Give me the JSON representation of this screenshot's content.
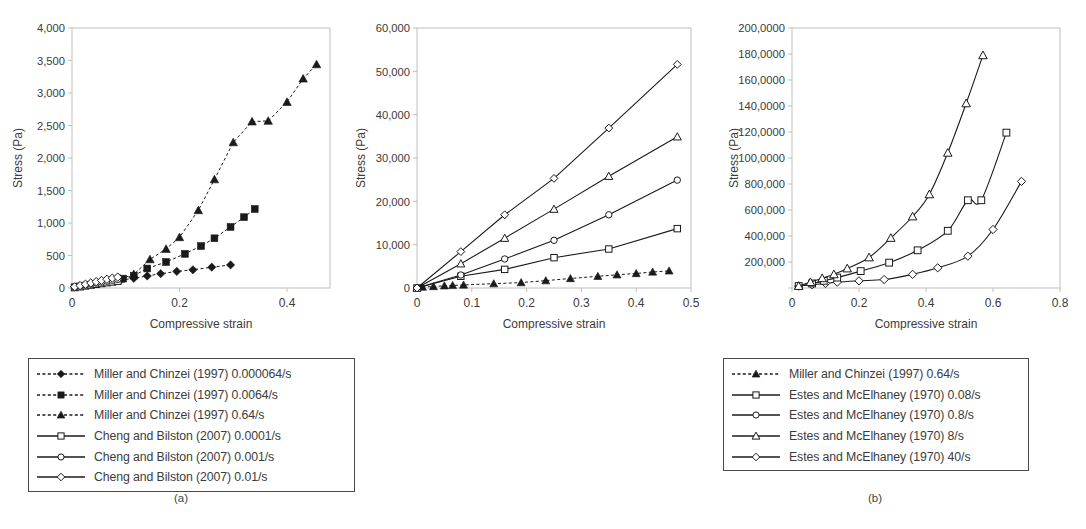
{
  "figure": {
    "background": "#ffffff",
    "line_color": "#1a1a1a",
    "axis_color": "#bfbfbf",
    "text_color": "#3b3b3b"
  },
  "panels": [
    {
      "id": "a",
      "caption": "(a)",
      "xlabel": "Compressive strain",
      "ylabel": "Stress (Pa)",
      "legend": [
        {
          "label": "Miller and Chinzei (1997) 0.000064/s",
          "marker": "diamond-filled",
          "line": "dashed"
        },
        {
          "label": "Miller and Chinzei (1997) 0.0064/s",
          "marker": "square-filled",
          "line": "dashed"
        },
        {
          "label": "Miller and Chinzei (1997) 0.64/s",
          "marker": "triangle-filled",
          "line": "dashed"
        },
        {
          "label": "Cheng and Bilston (2007) 0.0001/s",
          "marker": "square-open",
          "line": "solid"
        },
        {
          "label": "Cheng and Bilston (2007) 0.001/s",
          "marker": "circle-open",
          "line": "solid"
        },
        {
          "label": "Cheng and Bilston (2007) 0.01/s",
          "marker": "diamond-open",
          "line": "solid"
        }
      ]
    },
    {
      "id": "b",
      "caption": "(b)",
      "xlabel": "Compressive strain",
      "ylabel": "Stress (Pa)",
      "legend": [
        {
          "label": "Miller and Chinzei (1997) 0.64/s",
          "marker": "triangle-filled",
          "line": "dashed"
        },
        {
          "label": "Estes and McElhaney (1970) 0.08/s",
          "marker": "square-open",
          "line": "solid"
        },
        {
          "label": "Estes and McElhaney (1970) 0.8/s",
          "marker": "circle-open",
          "line": "solid"
        },
        {
          "label": "Estes and McElhaney (1970) 8/s",
          "marker": "triangle-open",
          "line": "solid"
        },
        {
          "label": "Estes and McElhaney (1970) 40/s",
          "marker": "diamond-open",
          "line": "solid"
        }
      ]
    },
    {
      "id": "c",
      "caption": "(c)",
      "xlabel": "Compressive strain",
      "ylabel": "Stress (Pa)",
      "legend": [
        {
          "label": "Pervin and Chen (2009) 1000/s",
          "marker": "diamond-open",
          "line": "solid"
        },
        {
          "label": "Pervin and Chen (2009) 2000/s",
          "marker": "square-open",
          "line": "solid"
        },
        {
          "label": "Pervin and Chen (2009) 3000/s",
          "marker": "triangle-open",
          "line": "solid"
        }
      ]
    }
  ],
  "chart_data": [
    {
      "panel": "a",
      "type": "line",
      "title": "",
      "xlabel": "Compressive strain",
      "ylabel": "Stress (Pa)",
      "xlim": [
        0,
        0.48
      ],
      "ylim": [
        0,
        4000
      ],
      "xticks": [
        0,
        0.2,
        0.4
      ],
      "xticklabels": [
        "0",
        "0.2",
        "0.4"
      ],
      "yticks": [
        0,
        500,
        1000,
        1500,
        2000,
        2500,
        3000,
        3500,
        4000
      ],
      "yticklabels": [
        "0",
        "500",
        "1,000",
        "1,500",
        "2,000",
        "2,500",
        "3,000",
        "3,500",
        "4,000"
      ],
      "grid": false,
      "legend_position": "below",
      "series": [
        {
          "name": "Miller and Chinzei (1997) 0.000064/s",
          "marker": "diamond-filled",
          "line": "dashed",
          "x": [
            0.09,
            0.115,
            0.14,
            0.165,
            0.195,
            0.225,
            0.26,
            0.295
          ],
          "y": [
            120,
            150,
            185,
            220,
            255,
            280,
            320,
            355
          ]
        },
        {
          "name": "Miller and Chinzei (1997) 0.0064/s",
          "marker": "square-filled",
          "line": "dashed",
          "x": [
            0.095,
            0.115,
            0.14,
            0.175,
            0.21,
            0.24,
            0.265,
            0.295,
            0.32,
            0.34
          ],
          "y": [
            145,
            190,
            300,
            400,
            525,
            645,
            765,
            940,
            1090,
            1215
          ]
        },
        {
          "name": "Miller and Chinzei (1997) 0.64/s",
          "marker": "triangle-filled",
          "line": "dashed",
          "x": [
            0.09,
            0.115,
            0.145,
            0.175,
            0.2,
            0.235,
            0.265,
            0.3,
            0.335,
            0.365,
            0.4,
            0.43,
            0.455
          ],
          "y": [
            140,
            210,
            440,
            600,
            780,
            1195,
            1670,
            2240,
            2560,
            2570,
            2860,
            3220,
            3440
          ]
        },
        {
          "name": "Cheng and Bilston (2007) 0.0001/s",
          "marker": "square-open",
          "line": "solid",
          "x": [
            0.005,
            0.015,
            0.025,
            0.035,
            0.045,
            0.055,
            0.065,
            0.075,
            0.085
          ],
          "y": [
            10,
            22,
            35,
            48,
            60,
            72,
            85,
            96,
            108
          ]
        },
        {
          "name": "Cheng and Bilston (2007) 0.001/s",
          "marker": "circle-open",
          "line": "solid",
          "x": [
            0.005,
            0.015,
            0.025,
            0.035,
            0.045,
            0.055,
            0.065,
            0.075,
            0.085
          ],
          "y": [
            14,
            30,
            46,
            62,
            78,
            93,
            108,
            122,
            136
          ]
        },
        {
          "name": "Cheng and Bilston (2007) 0.01/s",
          "marker": "diamond-open",
          "line": "solid",
          "x": [
            0.005,
            0.015,
            0.025,
            0.035,
            0.045,
            0.055,
            0.065,
            0.075,
            0.085
          ],
          "y": [
            18,
            38,
            58,
            78,
            98,
            116,
            134,
            152,
            168
          ]
        }
      ]
    },
    {
      "panel": "b",
      "type": "line",
      "title": "",
      "xlabel": "Compressive strain",
      "ylabel": "Stress (Pa)",
      "xlim": [
        0,
        0.5
      ],
      "ylim": [
        0,
        60000
      ],
      "xticks": [
        0,
        0.1,
        0.2,
        0.3,
        0.4,
        0.5
      ],
      "xticklabels": [
        "0",
        "0.1",
        "0.2",
        "0.3",
        "0.4",
        "0.5"
      ],
      "yticks": [
        0,
        10000,
        20000,
        30000,
        40000,
        50000,
        60000
      ],
      "yticklabels": [
        "0",
        "10,000",
        "20,000",
        "30,000",
        "40,000",
        "50,000",
        "60,000"
      ],
      "grid": false,
      "legend_position": "below",
      "series": [
        {
          "name": "Miller and Chinzei (1997) 0.64/s",
          "marker": "triangle-filled",
          "line": "dashed",
          "x": [
            0.01,
            0.03,
            0.05,
            0.065,
            0.085,
            0.14,
            0.19,
            0.235,
            0.28,
            0.33,
            0.365,
            0.4,
            0.43,
            0.46
          ],
          "y": [
            200,
            350,
            500,
            600,
            700,
            1000,
            1250,
            1700,
            2200,
            2700,
            3050,
            3350,
            3700,
            3950
          ]
        },
        {
          "name": "Estes and McElhaney (1970) 0.08/s",
          "marker": "square-open",
          "line": "solid",
          "x": [
            0.0,
            0.08,
            0.16,
            0.25,
            0.35,
            0.475
          ],
          "y": [
            0,
            2700,
            4300,
            7000,
            9000,
            13700
          ]
        },
        {
          "name": "Estes and McElhaney (1970) 0.8/s",
          "marker": "circle-open",
          "line": "solid",
          "x": [
            0.0,
            0.08,
            0.16,
            0.25,
            0.35,
            0.475
          ],
          "y": [
            0,
            3000,
            6700,
            11000,
            16900,
            24900
          ]
        },
        {
          "name": "Estes and McElhaney (1970) 8/s",
          "marker": "triangle-open",
          "line": "solid",
          "x": [
            0.0,
            0.08,
            0.16,
            0.25,
            0.35,
            0.475
          ],
          "y": [
            0,
            5600,
            11500,
            18200,
            25800,
            34900
          ]
        },
        {
          "name": "Estes and McElhaney (1970) 40/s",
          "marker": "diamond-open",
          "line": "solid",
          "x": [
            0.0,
            0.08,
            0.16,
            0.25,
            0.35,
            0.475
          ],
          "y": [
            0,
            8400,
            16900,
            25300,
            36900,
            51600
          ]
        }
      ]
    },
    {
      "panel": "c",
      "type": "line",
      "title": "",
      "xlabel": "Compressive strain",
      "ylabel": "Stress (Pa)",
      "xlim": [
        0,
        0.8
      ],
      "ylim": [
        0,
        2000000
      ],
      "xticks": [
        0,
        0.2,
        0.4,
        0.6,
        0.8
      ],
      "xticklabels": [
        "0",
        "0.2",
        "0.4",
        "0.6",
        "0.8"
      ],
      "yticks": [
        0,
        200000,
        400000,
        600000,
        800000,
        1000000,
        1200000,
        1400000,
        1600000,
        1800000,
        2000000
      ],
      "yticklabels": [
        "",
        "200,000",
        "400,000",
        "600,000",
        "800,000",
        "100,0000",
        "120,0000",
        "140,0000",
        "160,0000",
        "180,0000",
        "200,0000"
      ],
      "grid": false,
      "legend_position": "below",
      "series": [
        {
          "name": "Pervin and Chen (2009) 1000/s",
          "marker": "diamond-open",
          "line": "solid",
          "x": [
            0.02,
            0.06,
            0.1,
            0.135,
            0.2,
            0.275,
            0.36,
            0.435,
            0.525,
            0.6,
            0.685
          ],
          "y": [
            15000,
            25000,
            35000,
            45000,
            55000,
            65000,
            105000,
            155000,
            245000,
            450000,
            820000
          ]
        },
        {
          "name": "Pervin and Chen (2009) 2000/s",
          "marker": "square-open",
          "line": "solid",
          "x": [
            0.02,
            0.06,
            0.095,
            0.135,
            0.205,
            0.29,
            0.375,
            0.465,
            0.525,
            0.565,
            0.64
          ],
          "y": [
            15000,
            35000,
            55000,
            80000,
            130000,
            195000,
            290000,
            440000,
            675000,
            675000,
            1195000
          ]
        },
        {
          "name": "Pervin and Chen (2009) 3000/s",
          "marker": "triangle-open",
          "line": "solid",
          "x": [
            0.02,
            0.055,
            0.09,
            0.125,
            0.165,
            0.23,
            0.295,
            0.36,
            0.41,
            0.465,
            0.52,
            0.57
          ],
          "y": [
            15000,
            45000,
            75000,
            105000,
            150000,
            235000,
            385000,
            550000,
            720000,
            1040000,
            1420000,
            1790000
          ]
        }
      ]
    }
  ]
}
